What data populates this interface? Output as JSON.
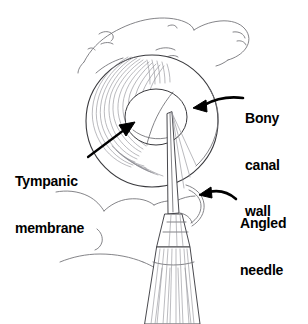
{
  "figure": {
    "background_color": "#ffffff",
    "width": 308,
    "height": 324,
    "style": "black-and-white line drawing / medical illustration"
  },
  "labels": {
    "bony_canal_wall": {
      "text": "Bony\ncanal\nwall",
      "line1": "Bony",
      "line2": "canal",
      "line3": "wall",
      "color": "#000000"
    },
    "tympanic_membrane": {
      "text": "Tympanic\nmembrane",
      "line1": "Tympanic",
      "line2": "membrane",
      "color": "#000000"
    },
    "angled_needle": {
      "text": "Angled\nneedle",
      "line1": "Angled",
      "line2": "needle",
      "color": "#000000"
    }
  },
  "annotations": [
    {
      "name": "bony-canal-wall-leader",
      "type": "curved-arrow",
      "points_to": "bony canal wall (right inner rim of ear canal)",
      "direction": "leftward",
      "color": "#000000"
    },
    {
      "name": "tympanic-membrane-leader",
      "type": "straight-arrow",
      "points_to": "tympanic membrane (deep left of canal)",
      "direction": "up-right",
      "color": "#000000"
    },
    {
      "name": "angled-needle-leader",
      "type": "curved-arrow",
      "points_to": "needle shaft",
      "direction": "leftward",
      "color": "#000000"
    }
  ],
  "anatomy": [
    {
      "name": "upper-hand",
      "description": "Clinician's hand/fingers retracting the auricle from above",
      "stroke": "#6e6e72"
    },
    {
      "name": "lower-hand",
      "description": "Clinician's fingers supporting below the ear",
      "stroke": "#6e6e72"
    },
    {
      "name": "ear-canal-circle",
      "description": "Outer circular rim of the external auditory canal / bony canal wall",
      "stroke": "#3a3a3e"
    },
    {
      "name": "tympanic-membrane-ellipse",
      "description": "Oval tympanic membrane seen down the canal",
      "stroke": "#3a3a3e"
    },
    {
      "name": "canal-wall-hatching",
      "description": "Concentric shading lines along the left canal wall",
      "stroke": "#8b8b92"
    }
  ],
  "instrument": {
    "name": "angled-needle-syringe",
    "parts": [
      {
        "name": "needle-shaft",
        "description": "Thin angled needle entering the canal toward the tympanic membrane"
      },
      {
        "name": "needle-hub",
        "description": "Conical hub connecting shaft to barrel"
      },
      {
        "name": "syringe-barrel",
        "description": "Tapered hatched barrel held below"
      }
    ],
    "stroke": "#3f3f44"
  }
}
